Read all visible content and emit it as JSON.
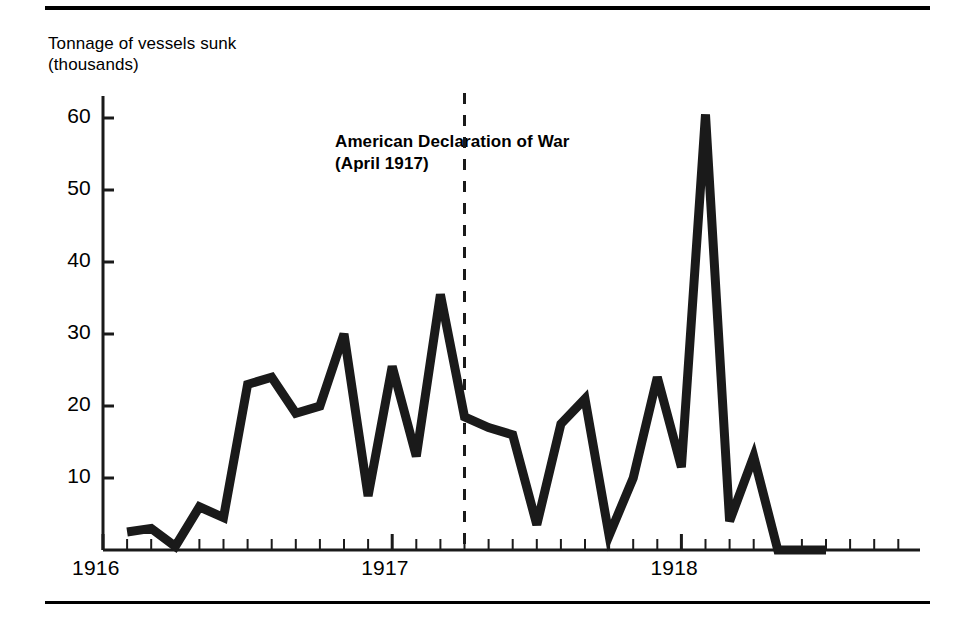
{
  "figure": {
    "axis_caption": "Tonnage of vessels sunk\n(thousands)",
    "annotation": "American Declaration of War\n(April 1917)",
    "ink_color": "#1a1a1a",
    "rule_color": "#000000"
  },
  "chart_data": {
    "type": "line",
    "title": "",
    "subtitle": "",
    "xlabel": "",
    "ylabel": "Tonnage of vessels sunk (thousands)",
    "ylim": [
      0,
      65
    ],
    "yticks": [
      10,
      20,
      30,
      40,
      50,
      60
    ],
    "ytick_labels": [
      "10",
      "20",
      "30",
      "40",
      "50",
      "60"
    ],
    "xtick_labels": [
      "1916",
      "1917",
      "1918"
    ],
    "xtick_label_months": [
      "1916-01",
      "1917-01",
      "1918-01"
    ],
    "grid": false,
    "legend": "none",
    "x_minor_ticks": "monthly",
    "annotations": [
      {
        "label": "American Declaration of War (April 1917)",
        "type": "vertical-dashed-line",
        "x": "1917-04"
      }
    ],
    "series": [
      {
        "name": "Tonnage of vessels sunk",
        "units": "thousands of tons",
        "x": [
          "1916-02",
          "1916-03",
          "1916-04",
          "1916-05",
          "1916-06",
          "1916-07",
          "1916-08",
          "1916-09",
          "1916-10",
          "1916-11",
          "1916-12",
          "1917-01",
          "1917-02",
          "1917-03",
          "1917-04",
          "1917-05",
          "1917-06",
          "1917-07",
          "1917-08",
          "1917-09",
          "1917-10",
          "1917-11",
          "1917-12",
          "1918-01",
          "1918-02",
          "1918-03",
          "1918-04",
          "1918-05",
          "1918-06",
          "1918-07"
        ],
        "values": [
          2.5,
          3.0,
          0.5,
          6.0,
          4.5,
          23.0,
          24.0,
          19.0,
          20.0,
          30.0,
          7.5,
          25.5,
          13.0,
          35.5,
          18.5,
          17.0,
          16.0,
          3.5,
          17.5,
          21.0,
          2.0,
          10.0,
          24.0,
          11.5,
          60.5,
          4.0,
          13.0,
          0.0,
          0.0,
          0.0
        ]
      }
    ]
  }
}
